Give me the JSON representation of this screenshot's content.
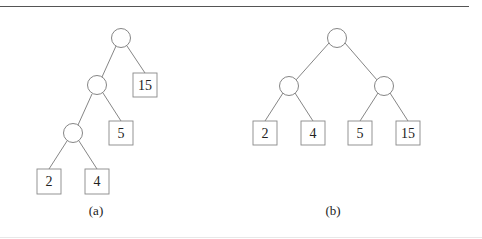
{
  "figure": {
    "panels": [
      {
        "label": "(a)",
        "description": "Unbalanced (left-leaning) binary tree",
        "internal_nodes": 3,
        "leaves": [
          "2",
          "4",
          "5",
          "15"
        ]
      },
      {
        "label": "(b)",
        "description": "Balanced binary tree",
        "internal_nodes": 3,
        "leaves": [
          "2",
          "4",
          "5",
          "15"
        ]
      }
    ]
  },
  "colors": {
    "edge": "#777777",
    "box_border": "#888888",
    "text": "#222222",
    "rule": "#555555"
  }
}
